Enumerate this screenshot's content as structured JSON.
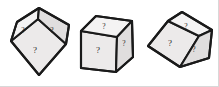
{
  "figure": {
    "background_color": "#ffffff",
    "border_color": "#d8d8d8",
    "edge_color": "#1a1a1a",
    "face_colors": {
      "front": "#eceaea",
      "top": "#f4f3f3",
      "side": "#e0dede"
    },
    "label_color": "#2a2a2a",
    "width": 219,
    "height": 87,
    "cube_count": 3,
    "face_label": "?",
    "cubes": [
      {
        "id": "cube-1",
        "name": "left-cube",
        "orientation": "vertex-up diamond view, rotated counter-clockwise",
        "faces": [
          {
            "id": "cube-1-face-front",
            "name": "front-face",
            "label": "?"
          },
          {
            "id": "cube-1-face-top",
            "name": "top-left-face",
            "label": "?"
          },
          {
            "id": "cube-1-face-side",
            "name": "top-right-face",
            "label": "?"
          }
        ]
      },
      {
        "id": "cube-2",
        "name": "middle-cube",
        "orientation": "upright isometric view, slightly tilted",
        "faces": [
          {
            "id": "cube-2-face-front",
            "name": "front-face",
            "label": "?"
          },
          {
            "id": "cube-2-face-top",
            "name": "top-face",
            "label": "?"
          },
          {
            "id": "cube-2-face-side",
            "name": "right-face",
            "label": "?"
          }
        ]
      },
      {
        "id": "cube-3",
        "name": "right-cube",
        "orientation": "tilted clockwise, front face facing lower-left",
        "faces": [
          {
            "id": "cube-3-face-front",
            "name": "front-face",
            "label": "?"
          },
          {
            "id": "cube-3-face-top",
            "name": "top-face",
            "label": "?"
          },
          {
            "id": "cube-3-face-side",
            "name": "right-face",
            "label": "?"
          }
        ]
      }
    ]
  }
}
